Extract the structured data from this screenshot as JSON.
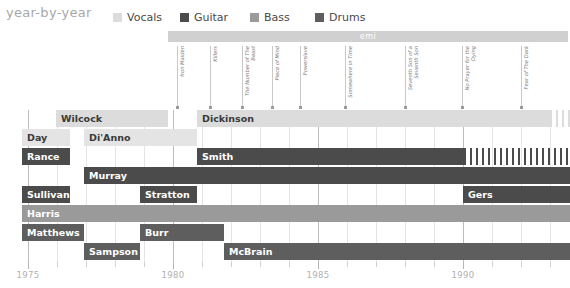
{
  "header": {
    "title": "year-by-year",
    "legend": [
      {
        "label": "Vocals",
        "color": "#dcdcdc",
        "x": 113
      },
      {
        "label": "Guitar",
        "color": "#4b4b4b",
        "x": 180
      },
      {
        "label": "Bass",
        "color": "#9a9a9a",
        "x": 250
      },
      {
        "label": "Drums",
        "color": "#5e5e5e",
        "x": 315
      }
    ]
  },
  "label_band": {
    "label_bar": {
      "text": "emi",
      "color": "#d0d0d0",
      "x": 168,
      "width": 400
    },
    "albums": [
      {
        "name": "Iron Maiden",
        "x": 177
      },
      {
        "name": "Killers",
        "x": 210
      },
      {
        "name": "The Number of The Beast",
        "x": 242
      },
      {
        "name": "Piece of Mind",
        "x": 272
      },
      {
        "name": "Powerslave",
        "x": 300
      },
      {
        "name": "Somewhere in Time",
        "x": 345
      },
      {
        "name": "Seventh Son of a Seventh Son",
        "x": 405
      },
      {
        "name": "No Prayer for the Dying",
        "x": 462
      },
      {
        "name": "Fear of The Dark",
        "x": 521
      }
    ]
  },
  "chart_data": {
    "type": "bar",
    "title": "year-by-year",
    "xlabel": "",
    "ylabel": "",
    "xlim": [
      1975,
      1994
    ],
    "grid": true,
    "legend_position": "top",
    "categories": [
      "Vocals",
      "Guitar",
      "Bass",
      "Drums"
    ],
    "axis": {
      "major_ticks": [
        1975,
        1980,
        1985,
        1990
      ],
      "tick_labels": [
        "1975",
        "1980",
        "1985",
        "1990"
      ],
      "minor_ticks": [
        1976,
        1977,
        1978,
        1979,
        1981,
        1982,
        1983,
        1984,
        1986,
        1987,
        1988,
        1989,
        1991,
        1992,
        1993
      ]
    },
    "rows": [
      {
        "index": 0,
        "y": 0,
        "bars": [
          {
            "name": "Wilcock",
            "role": "Vocals",
            "color": "#dcdcdc",
            "text": "#3a3a3a",
            "x": 56,
            "width": 112
          },
          {
            "name": "Dickinson",
            "role": "Vocals",
            "color": "#dcdcdc",
            "text": "#3a3a3a",
            "x": 197,
            "width": 355,
            "stripes": {
              "x": 556,
              "width": 14,
              "gap": 6,
              "color": "#dcdcdc"
            }
          }
        ]
      },
      {
        "index": 1,
        "y": 19,
        "bars": [
          {
            "name": "Day",
            "role": "Vocals",
            "color": "#e4e4e4",
            "text": "#3a3a3a",
            "x": 22,
            "width": 48
          },
          {
            "name": "Di'Anno",
            "role": "Vocals",
            "color": "#e4e4e4",
            "text": "#3a3a3a",
            "x": 84,
            "width": 113
          }
        ]
      },
      {
        "index": 2,
        "y": 38,
        "bars": [
          {
            "name": "Rance",
            "role": "Guitar",
            "color": "#4b4b4b",
            "text": "#ffffff",
            "x": 22,
            "width": 48
          },
          {
            "name": "Smith",
            "role": "Guitar",
            "color": "#4b4b4b",
            "text": "#ffffff",
            "x": 197,
            "width": 267,
            "stripes": {
              "x": 464,
              "width": 106,
              "gap": 6,
              "color": "#4b4b4b"
            }
          }
        ]
      },
      {
        "index": 3,
        "y": 57,
        "bars": [
          {
            "name": "Murray",
            "role": "Guitar",
            "color": "#4b4b4b",
            "text": "#ffffff",
            "x": 84,
            "width": 486
          }
        ]
      },
      {
        "index": 4,
        "y": 76,
        "bars": [
          {
            "name": "Sullivan",
            "role": "Guitar",
            "color": "#4b4b4b",
            "text": "#ffffff",
            "x": 22,
            "width": 48
          },
          {
            "name": "Stratton",
            "role": "Guitar",
            "color": "#4b4b4b",
            "text": "#ffffff",
            "x": 140,
            "width": 57
          },
          {
            "name": "Gers",
            "role": "Guitar",
            "color": "#4b4b4b",
            "text": "#ffffff",
            "x": 463,
            "width": 107
          }
        ]
      },
      {
        "index": 5,
        "y": 95,
        "bars": [
          {
            "name": "Harris",
            "role": "Bass",
            "color": "#9a9a9a",
            "text": "#ffffff",
            "x": 22,
            "width": 548
          }
        ]
      },
      {
        "index": 6,
        "y": 114,
        "bars": [
          {
            "name": "Matthews",
            "role": "Drums",
            "color": "#5e5e5e",
            "text": "#ffffff",
            "x": 22,
            "width": 62
          },
          {
            "name": "Burr",
            "role": "Drums",
            "color": "#5e5e5e",
            "text": "#ffffff",
            "x": 140,
            "width": 84
          }
        ]
      },
      {
        "index": 7,
        "y": 133,
        "bars": [
          {
            "name": "Sampson",
            "role": "Drums",
            "color": "#5e5e5e",
            "text": "#ffffff",
            "x": 84,
            "width": 56
          },
          {
            "name": "McBrain",
            "role": "Drums",
            "color": "#5e5e5e",
            "text": "#ffffff",
            "x": 224,
            "width": 346
          }
        ]
      }
    ]
  }
}
